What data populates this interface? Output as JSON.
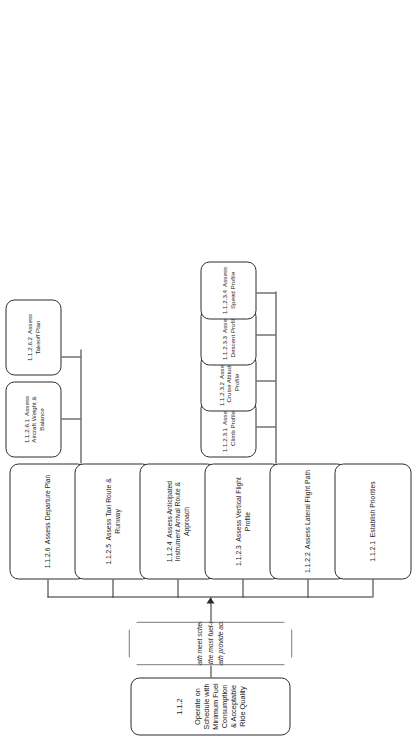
{
  "diagram": {
    "type": "hierarchical function decomposition tree",
    "orientation": "rotated 90 degrees (reads bottom-to-top)",
    "root": {
      "id": "1.1.2",
      "label": "Operate on Schedule with Minimum Fuel Consumption & Acceptable Ride Quality"
    },
    "decision": {
      "questions": [
        "Does planned flight path meet schedule?",
        "Is planned flight path the most fuel-efficient available?",
        "Does planned flight path provide acceptable ride quality?"
      ]
    },
    "children": [
      {
        "id": "1.1.2.1",
        "label": "Establish Priorities",
        "subs": []
      },
      {
        "id": "1.1.2.2",
        "label": "Assess Lateral Flight Path",
        "subs": []
      },
      {
        "id": "1.1.2.3",
        "label": "Assess Vertical Flight Profile",
        "subs": [
          {
            "id": "1.1.2.3.1",
            "label": "Assess Climb Profile"
          },
          {
            "id": "1.1.2.3.2",
            "label": "Assess Cruise Altitude Profile"
          },
          {
            "id": "1.1.2.3.3",
            "label": "Assess Descent Profile"
          },
          {
            "id": "1.1.2.3.4",
            "label": "Assess Speed Profile"
          }
        ]
      },
      {
        "id": "1.1.2.4",
        "label": "Assess Anticipated Instrument Arrival Route & Approach",
        "subs": []
      },
      {
        "id": "1.1.2.5",
        "label": "Assess Taxi Route & Runway",
        "subs": []
      },
      {
        "id": "1.1.2.6",
        "label": "Assess Departure Plan",
        "subs": [
          {
            "id": "1.1.2.6.1",
            "label": "Assess Aircraft Weight & Balance"
          },
          {
            "id": "1.1.2.6.2",
            "label": "Assess Takeoff Plan"
          }
        ]
      }
    ],
    "colors": {
      "stroke": "#2b2b2b",
      "fill": "#ffffff",
      "text": "#1a1a1a"
    }
  }
}
